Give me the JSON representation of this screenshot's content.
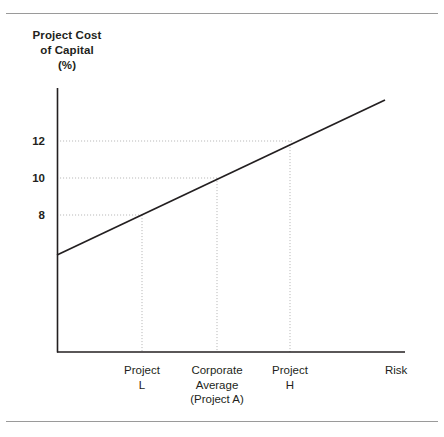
{
  "figure": {
    "axis_title_lines": [
      "Project Cost",
      "of Capital",
      "(%)"
    ],
    "axis_color": "#231f20",
    "line_color": "#231f20",
    "grid_color": "#b9b9b9",
    "rule_color": "#9a9a9a"
  },
  "chart_data": {
    "type": "line",
    "xlabel": "Risk",
    "ylabel": "Project Cost of Capital (%)",
    "grid": true,
    "legend": "none",
    "ytick_labels": [
      "12",
      "10",
      "8"
    ],
    "ytick_values": [
      12,
      10,
      8
    ],
    "ylim": [
      0,
      14
    ],
    "xtick_labels": [
      "Project\nL",
      "Corporate\nAverage\n(Project A)",
      "Project\nH",
      "Risk"
    ],
    "categories": [
      "Project L",
      "Corporate Average (Project A)",
      "Project H"
    ],
    "values": [
      8,
      10,
      12
    ],
    "series": [
      {
        "name": "Security Market Line",
        "points": [
          {
            "x": "origin",
            "y": 6.3
          },
          {
            "x": "Project L",
            "y": 8
          },
          {
            "x": "Corporate Average (Project A)",
            "y": 10
          },
          {
            "x": "Project H",
            "y": 12
          },
          {
            "x": "right edge",
            "y": 13.6
          }
        ]
      }
    ],
    "annotations": [
      {
        "label": "Project L",
        "y_value": 8,
        "dropline": true
      },
      {
        "label": "Corporate Average (Project A)",
        "y_value": 10,
        "dropline": true
      },
      {
        "label": "Project H",
        "y_value": 12,
        "dropline": true
      }
    ]
  },
  "axis_labels": {
    "y": [
      {
        "text": "12",
        "top": 135
      },
      {
        "text": "10",
        "top": 172
      },
      {
        "text": "8",
        "top": 209
      }
    ],
    "x": [
      {
        "lines": [
          "Project",
          "L"
        ],
        "center": 142
      },
      {
        "lines": [
          "Corporate",
          "Average",
          "(Project A)"
        ],
        "center": 217
      },
      {
        "lines": [
          "Project",
          "H"
        ],
        "center": 290
      },
      {
        "lines": [
          "Risk"
        ],
        "center": 420
      }
    ]
  }
}
